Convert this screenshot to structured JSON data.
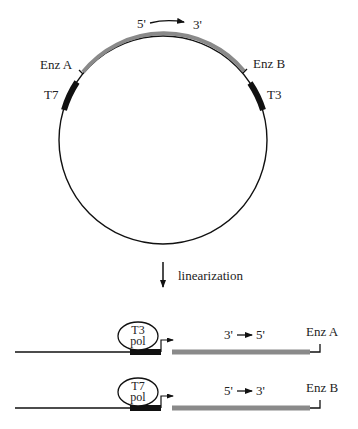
{
  "colors": {
    "backbone": "#111111",
    "insert": "#8a8a8a",
    "promoter": "#111111",
    "background": "#ffffff"
  },
  "plasmid": {
    "orientation_label": {
      "start": "5'",
      "end": "3'"
    },
    "site_left": "Enz A",
    "site_right": "Enz B",
    "promoter_left": "T7",
    "promoter_right": "T3"
  },
  "step": {
    "label": "linearization",
    "icon": "arrow-down-icon"
  },
  "constructs": [
    {
      "polymerase_line1": "T3",
      "polymerase_line2": "pol",
      "orientation_start": "3'",
      "orientation_end": "5'",
      "site": "Enz A"
    },
    {
      "polymerase_line1": "T7",
      "polymerase_line2": "pol",
      "orientation_start": "5'",
      "orientation_end": "3'",
      "site": "Enz B"
    }
  ]
}
